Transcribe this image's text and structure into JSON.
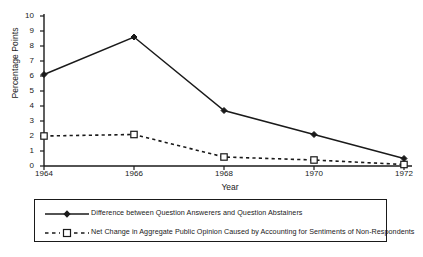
{
  "chart_data": {
    "type": "line",
    "title": "",
    "xlabel": "Year",
    "ylabel": "Percentage Points",
    "categories": [
      "1964",
      "1966",
      "1968",
      "1970",
      "1972"
    ],
    "x": [
      1964,
      1966,
      1968,
      1970,
      1972
    ],
    "xlim": [
      1964,
      1972
    ],
    "ylim": [
      0,
      10
    ],
    "yticks": [
      "0",
      "1",
      "2",
      "3",
      "4",
      "5",
      "6",
      "7",
      "8",
      "9",
      "10"
    ],
    "grid": false,
    "legend_position": "below-plot",
    "series": [
      {
        "name": "Difference between Question Answerers and Question Abstainers",
        "values": [
          6.1,
          8.6,
          3.7,
          2.1,
          0.5
        ],
        "line_style": "solid",
        "marker": "filled-diamond",
        "color": "#1a1a1a"
      },
      {
        "name": "Net Change in Aggregate Public Opinion Caused by Accounting for Sentiments of Non-Respondents",
        "values": [
          2.0,
          2.1,
          0.6,
          0.4,
          0.1
        ],
        "line_style": "dashed",
        "marker": "open-square",
        "color": "#1a1a1a"
      }
    ]
  },
  "legend": {
    "entries": [
      {
        "label": "Difference between Question Answerers and Question Abstainers"
      },
      {
        "label": "Net Change in Aggregate Public Opinion Caused by Accounting for Sentiments of Non-Respondents"
      }
    ]
  }
}
